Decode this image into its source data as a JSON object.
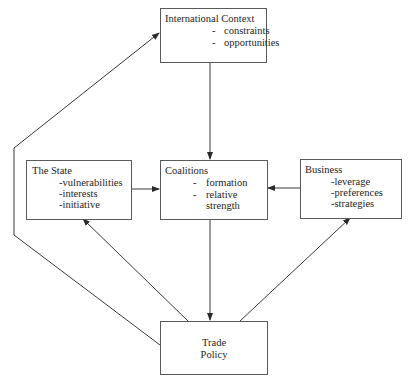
{
  "diagram": {
    "nodes": {
      "international_context": {
        "title": "International Context",
        "items": [
          "constraints",
          "opportunities"
        ],
        "bullet": "-"
      },
      "the_state": {
        "title": "The State",
        "items": [
          "-vulnerabilities",
          "-interests",
          "-initiative"
        ]
      },
      "coalitions": {
        "title": "Coalitions",
        "items": [
          "formation",
          "relative",
          "strength"
        ],
        "bullet": "-"
      },
      "business": {
        "title": "Business",
        "items": [
          "-leverage",
          "-preferences",
          "-strategies"
        ]
      },
      "trade_policy": {
        "lines": [
          "Trade",
          "Policy"
        ]
      }
    },
    "edges": [
      {
        "from": "International Context",
        "to": "Coalitions"
      },
      {
        "from": "The State",
        "to": "Coalitions"
      },
      {
        "from": "Business",
        "to": "Coalitions"
      },
      {
        "from": "Coalitions",
        "to": "Trade Policy"
      },
      {
        "from": "Trade Policy",
        "to": "The State"
      },
      {
        "from": "Trade Policy",
        "to": "Business"
      },
      {
        "from": "Trade Policy",
        "to": "International Context"
      }
    ],
    "colors": {
      "line": "#3a3a3a",
      "box_border": "#5a5a5a",
      "text": "#1e1e1e",
      "background": "#ffffff"
    }
  }
}
